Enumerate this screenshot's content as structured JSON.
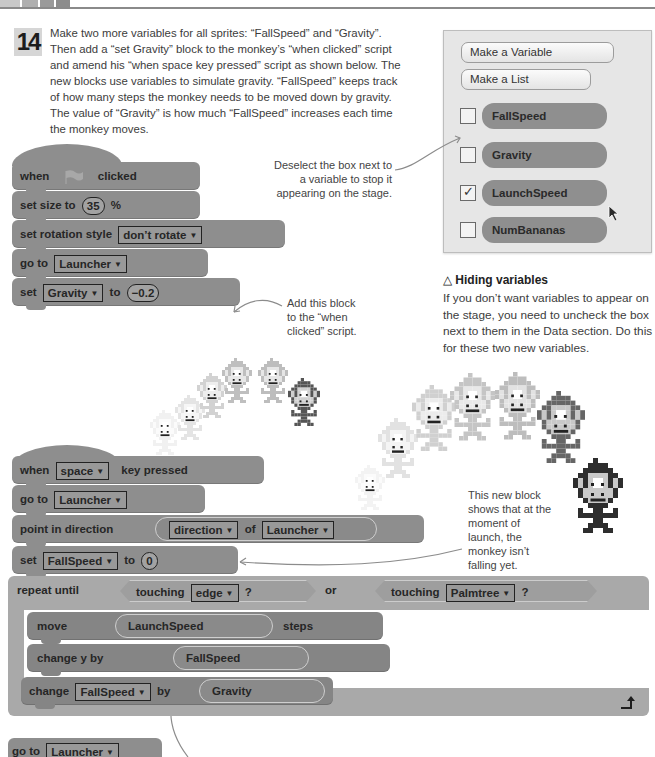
{
  "step": {
    "number": "14",
    "text": "Make two more variables for all sprites: “FallSpeed” and “Gravity”. Then add a “set Gravity” block to the monkey’s “when clicked” script and amend his “when space key pressed” script as shown below. The new blocks use variables to simulate gravity. “FallSpeed” keeps track of how many steps the monkey needs to be moved down by gravity. The value of “Gravity” is how much “FallSpeed” increases each time the monkey moves."
  },
  "data_panel": {
    "make_variable": "Make a Variable",
    "make_list": "Make a List",
    "variables": [
      {
        "name": "FallSpeed",
        "checked": false
      },
      {
        "name": "Gravity",
        "checked": false
      },
      {
        "name": "LaunchSpeed",
        "checked": true
      },
      {
        "name": "NumBananas",
        "checked": false
      }
    ],
    "check_glyph": "✓",
    "cursor_icon": "mouse-pointer-icon"
  },
  "annotations": {
    "deselect": "Deselect the box next to a variable to stop it appearing on the stage.",
    "add_block": "Add this block to the “when clicked” script.",
    "new_block_launch": "This new block shows that at the moment of launch, the monkey isn’t falling yet.",
    "new_block_down": "This new block moves the monkey down."
  },
  "hiding": {
    "icon": "△",
    "title": "Hiding variables",
    "body": "If you don’t want variables to appear on the stage, you need to uncheck the box next to them in the Data section. Do this for these two new variables."
  },
  "script1": {
    "when": "when",
    "clicked": "clicked",
    "flag_icon": "green-flag-icon",
    "set_size": "set size to",
    "size_value": "35",
    "percent": "%",
    "rotation": "set rotation style",
    "rotation_value": "don’t rotate",
    "goto": "go to",
    "goto_value": "Launcher",
    "set": "set",
    "set_var": "Gravity",
    "to": "to",
    "set_value": "−0.2"
  },
  "script2": {
    "when": "when",
    "key": "space",
    "key_pressed": "key pressed",
    "goto": "go to",
    "goto_value": "Launcher",
    "point": "point in direction",
    "direction": "direction",
    "of": "of",
    "of_value": "Launcher",
    "set": "set",
    "set_var": "FallSpeed",
    "to": "to",
    "set_value": "0",
    "repeat_until": "repeat until",
    "touching": "touching",
    "edge": "edge",
    "q": "?",
    "or": "or",
    "palmtree": "Palmtree",
    "move": "move",
    "launch_speed": "LaunchSpeed",
    "steps": "steps",
    "change_y": "change y by",
    "fall_speed": "FallSpeed",
    "change": "change",
    "change_var": "FallSpeed",
    "by": "by",
    "gravity": "Gravity",
    "loop_arrow": "↵",
    "goto2": "go to",
    "goto2_value": "Launcher"
  },
  "arrow": "▼"
}
